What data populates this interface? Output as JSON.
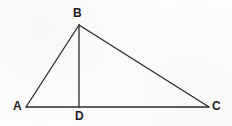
{
  "figure": {
    "background_color": "#fefefe",
    "stroke_color": "#2a2a2a",
    "label_color": "#1f1f1f",
    "width": 232,
    "height": 126
  },
  "labels": {
    "a": "A",
    "b": "B",
    "c": "C",
    "d": "D"
  },
  "geometry": {
    "points": {
      "A": {
        "x": 26,
        "y": 107
      },
      "B": {
        "x": 79,
        "y": 25
      },
      "C": {
        "x": 209,
        "y": 107
      },
      "D": {
        "x": 79,
        "y": 107
      }
    },
    "segments": [
      {
        "name": "AB",
        "from": "A",
        "to": "B"
      },
      {
        "name": "BC",
        "from": "B",
        "to": "C"
      },
      {
        "name": "AC",
        "from": "A",
        "to": "C"
      },
      {
        "name": "BD",
        "from": "B",
        "to": "D"
      }
    ],
    "label_positions": {
      "A": {
        "x": 13,
        "y": 100
      },
      "B": {
        "x": 73,
        "y": 7
      },
      "C": {
        "x": 212,
        "y": 100
      },
      "D": {
        "x": 75,
        "y": 110
      }
    }
  }
}
